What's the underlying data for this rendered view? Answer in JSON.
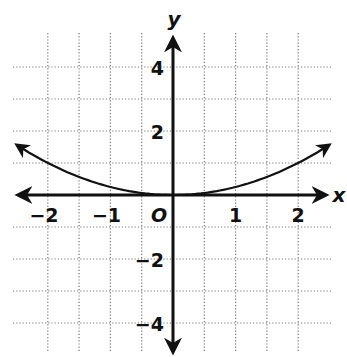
{
  "chart_data": {
    "type": "line",
    "title": "",
    "xlabel": "x",
    "ylabel": "y",
    "origin_label": "O",
    "xlim": [
      -2.5,
      2.5
    ],
    "ylim": [
      -5,
      5
    ],
    "x_ticks": [
      -2,
      -1,
      1,
      2
    ],
    "x_tick_labels": [
      "−2",
      "−1",
      "1",
      "2"
    ],
    "y_ticks": [
      4,
      2,
      -2,
      -4
    ],
    "y_tick_labels": [
      "4",
      "2",
      "−2",
      "−4"
    ],
    "grid": true,
    "grid_style": "dotted",
    "grid_x_step": 0.5,
    "grid_y_step": 1,
    "series": [
      {
        "name": "curve",
        "equation": "y = 0.25x^2",
        "arrows_both_ends": true,
        "x": [
          -2.5,
          -2,
          -1.5,
          -1,
          -0.5,
          0,
          0.5,
          1,
          1.5,
          2,
          2.5
        ],
        "y": [
          1.56,
          1,
          0.56,
          0.25,
          0.06,
          0,
          0.06,
          0.25,
          0.56,
          1,
          1.56
        ]
      }
    ],
    "colors": {
      "axis": "#111111",
      "grid": "#777777",
      "curve": "#111111"
    }
  }
}
